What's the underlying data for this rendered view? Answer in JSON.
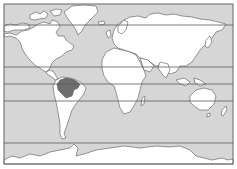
{
  "map": {
    "type": "world-map",
    "projection": "mercator-like",
    "colors": {
      "ocean": "#d6d6d6",
      "land": "#ffffff",
      "highlight": "#6e6e6e",
      "coastline": "#555555",
      "lines": "#5a5a5a",
      "frame": "#666666"
    },
    "highlighted_region": "amazon-basin",
    "reference_lines": [
      {
        "name": "arctic-circle",
        "y": 25
      },
      {
        "name": "tropic-of-cancer",
        "y": 67
      },
      {
        "name": "equator",
        "y": 84
      },
      {
        "name": "tropic-of-capricorn",
        "y": 101
      },
      {
        "name": "antarctic-circle",
        "y": 143
      }
    ]
  }
}
